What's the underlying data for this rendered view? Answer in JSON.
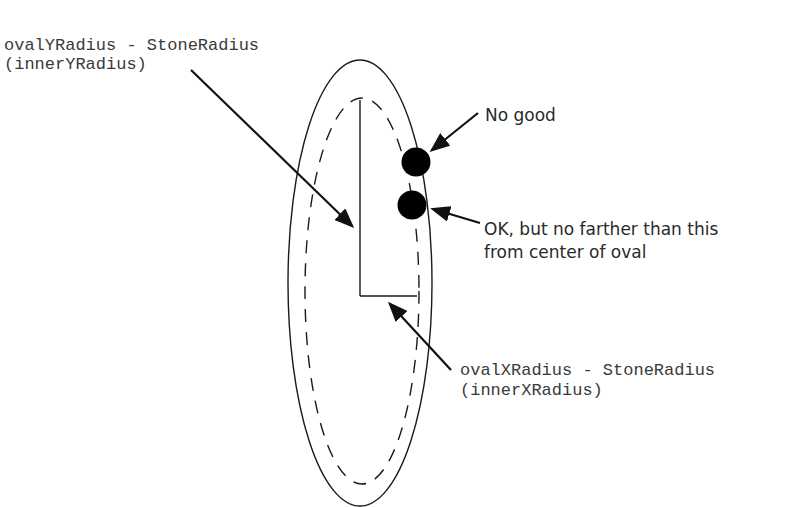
{
  "diagram": {
    "labels": {
      "inner_y": {
        "line1": "ovalYRadius - StoneRadius",
        "line2": "(innerYRadius)"
      },
      "inner_x": {
        "line1": "ovalXRadius - StoneRadius",
        "line2": "(innerXRadius)"
      },
      "no_good": "No good",
      "ok": {
        "line1": "OK, but no farther than this",
        "line2": "from center of oval"
      }
    },
    "shapes": {
      "outer_oval": {
        "cx": 360,
        "cy": 283,
        "rx": 72,
        "ry": 223,
        "style": "solid"
      },
      "inner_oval": {
        "cx": 362,
        "cy": 291,
        "rx": 57,
        "ry": 193,
        "style": "dashed"
      },
      "stones": [
        {
          "name": "no-good-stone",
          "cx": 416,
          "cy": 162,
          "r": 14
        },
        {
          "name": "ok-stone",
          "cx": 412,
          "cy": 205,
          "r": 14
        }
      ]
    },
    "colors": {
      "line": "#1a1a1a",
      "text": "#333333",
      "stone": "#000000",
      "background": "#ffffff"
    }
  }
}
